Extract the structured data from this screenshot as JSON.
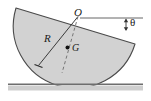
{
  "figure": {
    "labels": {
      "center_point": "O",
      "radius": "R",
      "centroid": "G",
      "angle": "θ"
    },
    "icons": {
      "centroid_dot": "centroid-dot-icon",
      "angle_arrow": "double-arrow-icon",
      "radius_tick": "tick-mark-icon"
    },
    "colors": {
      "body_fill": "#d2d2d2",
      "body_stroke": "#4a4a4a",
      "ground_line": "#6e6e6e",
      "ground_band": "#cfcfcf",
      "dashed_line": "#6a6a6a",
      "label_color": "#1a1a1a",
      "background": "#ffffff"
    },
    "geometry": {
      "center_O": [
        78,
        16
      ],
      "flat_edge_left": [
        16,
        8
      ],
      "flat_edge_right": [
        135,
        44
      ],
      "radius_end": [
        38,
        66
      ],
      "centroid_G": [
        67,
        48
      ],
      "ground_y": 84,
      "ground_x_start": 8,
      "ground_x_end": 143,
      "reference_line_y": 18,
      "reference_line_x_start": 80,
      "reference_line_x_end": 143,
      "angle_arrow_x": 126,
      "angle_arrow_y_top": 19,
      "angle_arrow_y_bottom": 30,
      "radius_value": 45,
      "tilt_angle_degrees": 17
    }
  }
}
